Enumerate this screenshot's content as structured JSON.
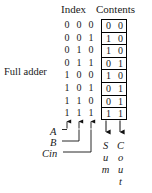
{
  "figure": {
    "caption": "Full adder",
    "headers": {
      "index": "Index",
      "contents": "Contents"
    }
  },
  "truth_table": {
    "index_bit_labels": [
      "A",
      "B",
      "Cin"
    ],
    "output_labels": {
      "sum": "Sum",
      "cout": "Cout"
    },
    "sum_stacked": [
      "S",
      "u",
      "m"
    ],
    "cout_stacked": [
      "C",
      "o",
      "u",
      "t"
    ],
    "rows": [
      {
        "index": [
          "0",
          "0",
          "0"
        ],
        "contents": [
          "0",
          "0"
        ]
      },
      {
        "index": [
          "0",
          "0",
          "1"
        ],
        "contents": [
          "1",
          "0"
        ]
      },
      {
        "index": [
          "0",
          "1",
          "0"
        ],
        "contents": [
          "1",
          "0"
        ]
      },
      {
        "index": [
          "0",
          "1",
          "1"
        ],
        "contents": [
          "0",
          "1"
        ]
      },
      {
        "index": [
          "1",
          "0",
          "0"
        ],
        "contents": [
          "1",
          "0"
        ]
      },
      {
        "index": [
          "1",
          "0",
          "1"
        ],
        "contents": [
          "0",
          "1"
        ]
      },
      {
        "index": [
          "1",
          "1",
          "0"
        ],
        "contents": [
          "0",
          "1"
        ]
      },
      {
        "index": [
          "1",
          "1",
          "1"
        ],
        "contents": [
          "1",
          "1"
        ]
      }
    ]
  },
  "colors": {
    "ink": "#1a1a1a",
    "rule": "#000000",
    "background": "#ffffff"
  }
}
